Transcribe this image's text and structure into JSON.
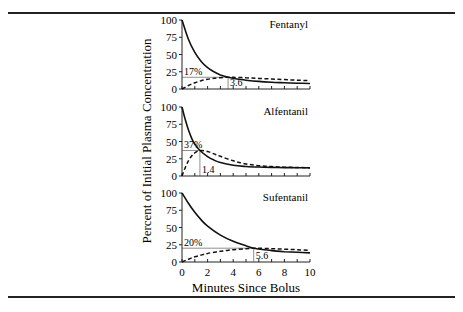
{
  "chart_data": {
    "type": "line",
    "layout": "3 vertically stacked panels sharing x-axis",
    "ylabel": "Percent of Initial Plasma Concentration",
    "xlabel": "Minutes Since Bolus",
    "xlim": [
      0,
      10
    ],
    "ylim": [
      0,
      100
    ],
    "x_ticks": [
      0,
      2,
      4,
      6,
      8,
      10
    ],
    "y_ticks": [
      0,
      25,
      50,
      75,
      100
    ],
    "grid": false,
    "legend": "none (solid = plasma, dashed = effect site)",
    "panels": [
      {
        "title": "Fentanyl",
        "peak_label": "17%",
        "peak_time_label": "3.6",
        "peak_time": 3.6,
        "peak_value": 17,
        "x": [
          0,
          0.5,
          1,
          1.5,
          2,
          2.5,
          3,
          3.6,
          4,
          5,
          6,
          7,
          8,
          9,
          10
        ],
        "series": [
          {
            "name": "Plasma",
            "style": "solid",
            "values": [
              100,
              72,
              53,
              40,
              31,
              25,
              20.5,
              17,
              15.5,
              12.8,
              11,
              9.8,
              9,
              8.4,
              8
            ]
          },
          {
            "name": "Effect site",
            "style": "dashed",
            "values": [
              0,
              5,
              9,
              12,
              14,
              15.5,
              16.4,
              17,
              16.9,
              16.3,
              15.4,
              14.5,
              13.6,
              12.8,
              12
            ]
          }
        ]
      },
      {
        "title": "Alfentanil",
        "peak_label": "37%",
        "peak_time_label": "1.4",
        "peak_time": 1.4,
        "peak_value": 37,
        "x": [
          0,
          0.25,
          0.5,
          0.75,
          1,
          1.4,
          2,
          2.5,
          3,
          4,
          5,
          6,
          7,
          8,
          9,
          10
        ],
        "series": [
          {
            "name": "Plasma",
            "style": "solid",
            "values": [
              100,
              82,
              67,
              55,
              46,
              37,
              28,
              23,
              19.5,
              15.5,
              13.8,
              13,
              12.5,
              12.2,
              12,
              11.8
            ]
          },
          {
            "name": "Effect site",
            "style": "dashed",
            "values": [
              0,
              12,
              22,
              29,
              33.5,
              37,
              35.5,
              32,
              28.5,
              22,
              17.5,
              15,
              13.6,
              12.8,
              12.3,
              12
            ]
          }
        ]
      },
      {
        "title": "Sufentanil",
        "peak_label": "20%",
        "peak_time_label": "5.6",
        "peak_time": 5.6,
        "peak_value": 20,
        "x": [
          0,
          0.5,
          1,
          1.5,
          2,
          3,
          4,
          5,
          5.6,
          6,
          7,
          8,
          9,
          10
        ],
        "series": [
          {
            "name": "Plasma",
            "style": "solid",
            "values": [
              100,
              85,
              72,
              61,
              52,
              39,
              30,
              23.5,
              20,
              18.8,
              16.5,
              15,
              14,
              13.2
            ]
          },
          {
            "name": "Effect site",
            "style": "dashed",
            "values": [
              0,
              4,
              7.5,
              10,
              12.5,
              15.5,
              17.8,
              19.3,
              20,
              19.9,
              19.3,
              18.5,
              17.8,
              17
            ]
          }
        ]
      }
    ]
  }
}
